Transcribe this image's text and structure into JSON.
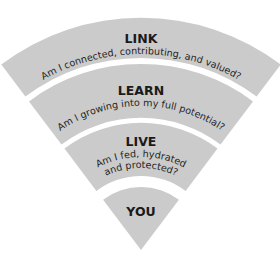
{
  "diagram": {
    "band_color": "#cbcbcb",
    "text_color": "#1a1a1a",
    "layers": [
      {
        "name": "LINK",
        "question": "Am I connected, contributing, and valued?"
      },
      {
        "name": "LEARN",
        "question": "Am I growing into my full potential?"
      },
      {
        "name": "LIVE",
        "question_line1": "Am I fed, hydrated",
        "question_line2": "and protected?"
      },
      {
        "name": "YOU"
      }
    ]
  }
}
